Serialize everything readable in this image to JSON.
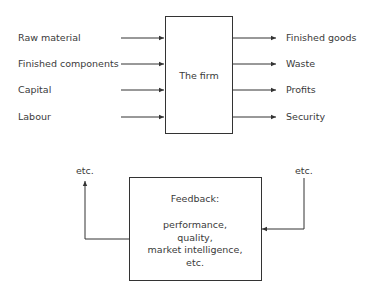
{
  "firm": {
    "label": "The firm",
    "inputs": [
      "Raw material",
      "Finished components",
      "Capital",
      "Labour"
    ],
    "outputs": [
      "Finished goods",
      "Waste",
      "Profits",
      "Security"
    ]
  },
  "feedback": {
    "title": "Feedback:",
    "items": [
      "performance,",
      "quality,",
      "market intelligence,",
      "etc."
    ],
    "left_label": "etc.",
    "right_label": "etc."
  }
}
